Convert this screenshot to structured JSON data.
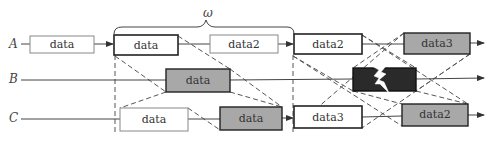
{
  "diagram": {
    "window_label": "ω",
    "channels": [
      {
        "id": "A",
        "label": "A"
      },
      {
        "id": "B",
        "label": "B"
      },
      {
        "id": "C",
        "label": "C"
      }
    ],
    "boxes": {
      "a1": "data",
      "a2": "data",
      "a3": "data2",
      "a4": "data2",
      "a5": "data3",
      "b1": "data",
      "b2": "",
      "c1": "data",
      "c2": "data",
      "c3": "data3",
      "c4": "data2"
    },
    "icons": {
      "b2": "lightning-icon"
    },
    "colors": {
      "line": "#444444",
      "dashed": "#555555",
      "box_gray": "#a8a8a8",
      "box_dark": "#2a2a2a",
      "box_white": "#ffffff",
      "light_border": "#8a8a8a"
    }
  }
}
